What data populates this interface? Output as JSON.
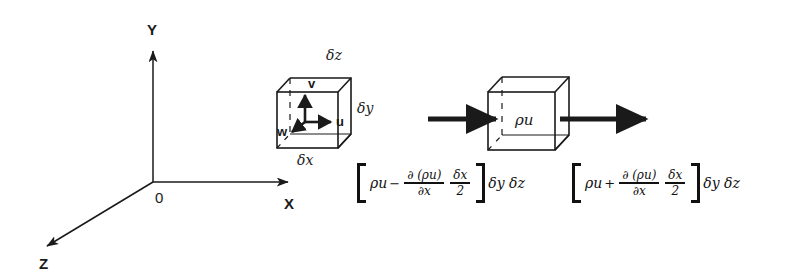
{
  "figure": {
    "background_color": "#ffffff",
    "stroke_color": "#1a1a1a",
    "axes": {
      "x_label": "X",
      "y_label": "Y",
      "z_label": "Z",
      "origin_label": "0"
    },
    "cube_velocity": {
      "velocity_u": "u",
      "velocity_v": "v",
      "velocity_w": "w",
      "edge_x": "δx",
      "edge_y": "δy",
      "edge_z": "δz"
    },
    "cube_flux": {
      "center_label": "ρu",
      "inflow_arrow": "inflow",
      "outflow_arrow": "outflow"
    },
    "equation_left": {
      "open_bracket": "[",
      "base_term": "ρu",
      "operator": "−",
      "frac1_num": "∂ (ρu)",
      "frac1_den": "∂x",
      "frac2_num": "δx",
      "frac2_den": "2",
      "close_bracket": "]",
      "tail": "δy δz"
    },
    "equation_right": {
      "open_bracket": "[",
      "base_term": "ρu",
      "operator": "+",
      "frac1_num": "∂ (ρu)",
      "frac1_den": "∂x",
      "frac2_num": "δx",
      "frac2_den": "2",
      "close_bracket": "]",
      "tail": "δy δz"
    }
  }
}
